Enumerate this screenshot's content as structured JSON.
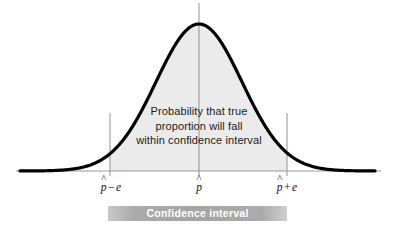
{
  "figure": {
    "type": "normal-distribution-confidence-interval",
    "background_color": "#ffffff"
  },
  "curve": {
    "fill_color": "#ebebeb",
    "stroke_color": "#000000",
    "stroke_width": 3.2,
    "baseline_color": "#9a9a9a",
    "tick_line_color": "#9a9a9a"
  },
  "caption": {
    "line1": "Probability that true",
    "line2": "proportion will fall",
    "line3": "within confidence interval"
  },
  "axis_labels": {
    "left": {
      "symbol": "p",
      "hat": "^",
      "operator": "−",
      "term": "e"
    },
    "center": {
      "symbol": "p",
      "hat": "^",
      "operator": "",
      "term": ""
    },
    "right": {
      "symbol": "p",
      "hat": "^",
      "operator": "+",
      "term": "e"
    }
  },
  "confidence_bar": {
    "label": "Confidence interval",
    "bar_color": "#a4a4a4",
    "text_color": "#ffffff"
  },
  "chart_data": {
    "type": "area",
    "title": "",
    "xlabel": "",
    "ylabel": "",
    "distribution": "normal",
    "mean_x_px": 199,
    "sigma_x_px": 43,
    "baseline_y_px": 171,
    "peak_y_px": 24,
    "x_start_px": 20,
    "x_end_px": 375,
    "axis_x_start_px": 16,
    "axis_x_end_px": 381,
    "shaded_region": {
      "from_px": 110,
      "to_px": 287,
      "label": "Confidence interval"
    },
    "markers": [
      {
        "name": "lower-bound",
        "x_px": 110,
        "label": "p̂ − e",
        "line_top_px": 113
      },
      {
        "name": "point-estimate",
        "x_px": 199,
        "label": "p̂",
        "line_top_px": 3
      },
      {
        "name": "upper-bound",
        "x_px": 287,
        "label": "p̂ + e",
        "line_top_px": 113
      }
    ],
    "grid": false,
    "legend": "none"
  }
}
